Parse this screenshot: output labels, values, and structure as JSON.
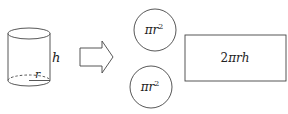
{
  "diagram": {
    "cylinder": {
      "height_label": "h",
      "radius_label": "r"
    },
    "arrow": {
      "direction": "right"
    },
    "circles": [
      {
        "label_base": "πr",
        "label_exp": "2"
      },
      {
        "label_base": "πr",
        "label_exp": "2"
      }
    ],
    "rectangle": {
      "label_coef": "2",
      "label_vars": "πrh"
    },
    "colors": {
      "stroke": "#444444",
      "text": "#222222",
      "background": "#ffffff"
    }
  }
}
